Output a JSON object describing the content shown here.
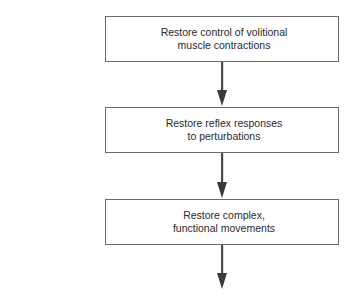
{
  "diagram": {
    "type": "flowchart",
    "direction": "top-to-bottom",
    "colors": {
      "box_border": "#6a6a6a",
      "arrow": "#4a4a4a",
      "text": "#2a2a2a",
      "background": "#ffffff"
    },
    "steps": [
      {
        "label": "Restore control of volitional\nmuscle contractions"
      },
      {
        "label": "Restore reflex responses\nto perturbations"
      },
      {
        "label": "Restore complex,\nfunctional movements"
      }
    ],
    "arrows": [
      {
        "from": 0,
        "to": 1
      },
      {
        "from": 1,
        "to": 2
      },
      {
        "from": 2,
        "to": null
      }
    ]
  }
}
